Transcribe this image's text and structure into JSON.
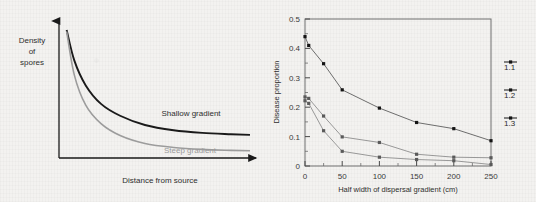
{
  "page": {
    "background_color": "#f3f2f0"
  },
  "chart_data": [
    {
      "id": "left-schematic",
      "type": "line",
      "title": "",
      "xlabel": "Distance from source",
      "ylabel": "Density of spores",
      "ylabel_lines": [
        "Density",
        "of",
        "spores"
      ],
      "axis_style": "arrow-axes",
      "grid": false,
      "legend_position": "inline-annotations",
      "xlim": [
        0,
        100
      ],
      "ylim": [
        0,
        100
      ],
      "x_tick_labels": [],
      "y_tick_labels": [],
      "series": [
        {
          "name": "Shallow gradient",
          "color": "#1a1a1a",
          "label": "Shallow gradient",
          "label_color": "#1a1a1a",
          "x": [
            4,
            8,
            14,
            22,
            32,
            45,
            60,
            75,
            90,
            100
          ],
          "values": [
            97,
            74,
            55,
            41,
            32,
            25,
            21,
            19,
            18,
            17.5
          ]
        },
        {
          "name": "Steep gradient",
          "color": "#9c9c9c",
          "label": "Steep gradient",
          "label_color": "#9c9c9c",
          "x": [
            4,
            8,
            14,
            22,
            32,
            45,
            60,
            75,
            90,
            100
          ],
          "values": [
            96,
            63,
            40,
            26,
            17,
            11,
            8,
            6.5,
            5.8,
            5.5
          ]
        }
      ]
    },
    {
      "id": "right-data",
      "type": "line",
      "title": "",
      "xlabel": "Half width of dispersal gradient (cm)",
      "ylabel": "Disease proportion",
      "grid": false,
      "frame": "box",
      "legend_position": "right-outside",
      "marker": "square",
      "xlim": [
        0,
        250
      ],
      "ylim": [
        0,
        0.5
      ],
      "x_ticks_major": [
        0,
        50,
        100,
        150,
        200,
        250
      ],
      "x_ticks_minor": [
        25,
        75,
        125,
        175,
        225
      ],
      "x_tick_labels": [
        "0",
        "50",
        "100",
        "150",
        "200",
        "250"
      ],
      "y_ticks_major": [
        0,
        0.1,
        0.2,
        0.3,
        0.4,
        0.5
      ],
      "y_ticks_minor": [
        0.05,
        0.15,
        0.25,
        0.35,
        0.45
      ],
      "y_tick_labels": [
        "0",
        "0.1",
        "0.2",
        "0.3",
        "0.4",
        "0.5"
      ],
      "series": [
        {
          "name": "1.1",
          "color": "#5d5d5d",
          "marker_color": "#141414",
          "x": [
            0,
            5,
            25,
            50,
            100,
            150,
            200,
            250
          ],
          "values": [
            0.44,
            0.41,
            0.348,
            0.259,
            0.197,
            0.148,
            0.127,
            0.086
          ]
        },
        {
          "name": "1.2",
          "color": "#8d8d8d",
          "marker_color": "#5a5a5a",
          "x": [
            0,
            5,
            25,
            50,
            100,
            150,
            200,
            250
          ],
          "values": [
            0.235,
            0.23,
            0.17,
            0.099,
            0.08,
            0.04,
            0.03,
            0.028
          ]
        },
        {
          "name": "1.3",
          "color": "#8d8d8d",
          "marker_color": "#5a5a5a",
          "x": [
            0,
            5,
            25,
            50,
            100,
            150,
            200,
            250
          ],
          "values": [
            0.222,
            0.213,
            0.12,
            0.05,
            0.03,
            0.022,
            0.018,
            0.005
          ]
        }
      ],
      "legend": [
        {
          "label": "1.1",
          "color": "#141414"
        },
        {
          "label": "1.2",
          "color": "#141414"
        },
        {
          "label": "1.3",
          "color": "#141414"
        }
      ]
    }
  ]
}
